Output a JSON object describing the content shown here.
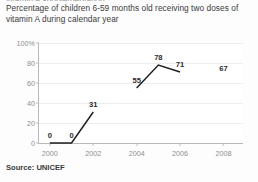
{
  "page": {
    "clipped_top_text": "vitamin A supplementation",
    "title": "Percentage of children 6-59 months old receiving two doses of vitamin A during calendar year",
    "source_label": "Source:",
    "source_value": "UNICEF",
    "source_text": "Source: UNICEF"
  },
  "colors": {
    "line": "#1f1f1f",
    "grid": "#ededed",
    "axis": "#b9b9b9",
    "tick_text": "#8f8f8f",
    "label_text": "#2b2b2b",
    "background": "#fdfdfd",
    "plot_background": "#ffffff"
  },
  "chart_data": {
    "type": "line",
    "title": "Percentage of children 6-59 months old receiving two doses of vitamin A during calendar year",
    "xlabel": "",
    "ylabel": "",
    "xlim": [
      1999.5,
      2008.9
    ],
    "ylim": [
      0,
      100
    ],
    "grid": true,
    "legend": "none",
    "source": "Source: UNICEF",
    "x_ticks": [
      {
        "value": 2000,
        "label": "2000"
      },
      {
        "value": 2002,
        "label": "2002"
      },
      {
        "value": 2004,
        "label": "2004"
      },
      {
        "value": 2006,
        "label": "2006"
      },
      {
        "value": 2008,
        "label": "2008"
      }
    ],
    "y_ticks": [
      {
        "value": 100,
        "label": "100%"
      },
      {
        "value": 80,
        "label": "80"
      },
      {
        "value": 60,
        "label": "60"
      },
      {
        "value": 40,
        "label": "40"
      },
      {
        "value": 20,
        "label": "20"
      },
      {
        "value": 0,
        "label": "0"
      }
    ],
    "x": [
      2000,
      2001,
      2002,
      2004,
      2005,
      2006,
      2008
    ],
    "values": [
      0,
      0,
      31,
      55,
      78,
      71,
      67
    ],
    "point_labels": [
      "0",
      "0",
      "31",
      "55",
      "78",
      "71",
      "67"
    ],
    "segments": [
      {
        "x": [
          2000,
          2001,
          2002
        ],
        "values": [
          0,
          0,
          31
        ]
      },
      {
        "x": [
          2004,
          2005,
          2006
        ],
        "values": [
          55,
          78,
          71
        ]
      }
    ],
    "unplotted_points": [
      {
        "x": 2008,
        "value": 67,
        "label": "67",
        "note": "label shown without connecting line"
      }
    ],
    "series": [
      {
        "name": "two doses of vitamin A",
        "x": [
          2000,
          2001,
          2002,
          2004,
          2005,
          2006,
          2008
        ],
        "values": [
          0,
          0,
          31,
          55,
          78,
          71,
          67
        ]
      }
    ]
  }
}
